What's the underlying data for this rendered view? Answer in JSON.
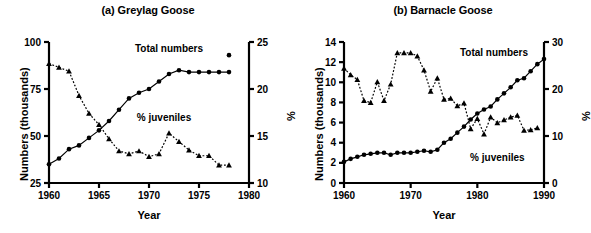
{
  "figure": {
    "panels": [
      {
        "id": "a",
        "title": "(a) Greylag Goose",
        "chart_index": 0
      },
      {
        "id": "b",
        "title": "(b) Barnacle Goose",
        "chart_index": 1
      }
    ]
  },
  "chart_data": [
    {
      "type": "line",
      "title": "(a) Greylag Goose",
      "xlabel": "Year",
      "ylabel": "Numbers (thousands)",
      "y2label": "%",
      "xlim": [
        1960,
        1980
      ],
      "ylim": [
        25,
        100
      ],
      "y2lim": [
        10,
        25
      ],
      "xticks": [
        1960,
        1965,
        1970,
        1975,
        1980
      ],
      "yticks": [
        25,
        50,
        75,
        100
      ],
      "y2ticks": [
        10,
        15,
        20,
        25
      ],
      "grid": false,
      "legend_position": "inline-annotation",
      "annotations": [
        {
          "text": "Total numbers",
          "x": 1972.0,
          "y_axis": "left",
          "y": 94.5
        },
        {
          "text": "% juveniles",
          "x": 1971.5,
          "y_axis": "right",
          "y": 16.6
        }
      ],
      "series": [
        {
          "name": "Total numbers",
          "axis": "left",
          "marker": "filled-circle",
          "linestyle": "solid",
          "x": [
            1960,
            1961,
            1962,
            1963,
            1964,
            1965,
            1966,
            1967,
            1968,
            1969,
            1970,
            1971,
            1972,
            1973,
            1974,
            1975,
            1976,
            1977,
            1978
          ],
          "values": [
            35,
            38,
            43,
            45,
            49,
            53,
            58,
            64,
            70,
            73,
            75,
            79,
            83,
            85,
            84,
            84,
            84,
            84,
            84
          ]
        },
        {
          "name": "Total numbers (continued)",
          "axis": "left",
          "marker": "filled-circle",
          "linestyle": "solid",
          "x": [
            1978
          ],
          "values": [
            93
          ]
        },
        {
          "name": "% juveniles",
          "axis": "right",
          "marker": "filled-triangle",
          "linestyle": "dotted",
          "x": [
            1960,
            1961,
            1962,
            1963,
            1964,
            1965,
            1966,
            1967,
            1968,
            1969,
            1970,
            1971,
            1972,
            1973,
            1974,
            1975,
            1976,
            1977,
            1978
          ],
          "values": [
            22.7,
            22.3,
            21.9,
            19.3,
            17.4,
            16.2,
            14.7,
            13.4,
            13.1,
            13.4,
            12.8,
            13.1,
            15.3,
            14.4,
            13.5,
            12.9,
            12.9,
            11.9,
            11.9
          ]
        }
      ]
    },
    {
      "type": "line",
      "title": "(b) Barnacle Goose",
      "xlabel": "Year",
      "ylabel": "Numbers (thousands)",
      "y2label": "%",
      "xlim": [
        1960,
        1990
      ],
      "ylim": [
        0,
        14
      ],
      "y2lim": [
        0,
        30
      ],
      "xticks": [
        1960,
        1970,
        1980,
        1990
      ],
      "yticks": [
        0,
        2,
        4,
        6,
        8,
        10,
        12,
        14
      ],
      "y2ticks": [
        0,
        10,
        20,
        30
      ],
      "grid": false,
      "legend_position": "inline-annotation",
      "annotations": [
        {
          "text": "Total numbers",
          "x": 1982.5,
          "y_axis": "left",
          "y": 12.6
        },
        {
          "text": "% juveniles",
          "x": 1983.0,
          "y_axis": "left",
          "y": 2.2
        }
      ],
      "series": [
        {
          "name": "Total numbers",
          "axis": "left",
          "marker": "filled-circle",
          "linestyle": "solid",
          "x": [
            1960,
            1961,
            1962,
            1963,
            1964,
            1965,
            1966,
            1967,
            1968,
            1969,
            1970,
            1971,
            1972,
            1973,
            1974,
            1975,
            1976,
            1977,
            1978,
            1979,
            1980,
            1981,
            1982,
            1983,
            1984,
            1985,
            1986,
            1987,
            1988,
            1989,
            1990
          ],
          "values": [
            2.1,
            2.4,
            2.6,
            2.8,
            2.9,
            3.0,
            3.0,
            2.8,
            3.0,
            3.0,
            3.0,
            3.1,
            3.2,
            3.1,
            3.3,
            4.0,
            4.4,
            5.0,
            5.6,
            6.3,
            6.9,
            7.3,
            7.6,
            8.3,
            8.9,
            9.5,
            10.2,
            10.4,
            11.1,
            11.8,
            12.3
          ]
        },
        {
          "name": "% juveniles",
          "axis": "right",
          "marker": "filled-triangle",
          "linestyle": "dotted",
          "x": [
            1960,
            1961,
            1962,
            1963,
            1964,
            1965,
            1966,
            1967,
            1968,
            1969,
            1970,
            1971,
            1972,
            1973,
            1974,
            1975,
            1976,
            1977,
            1978,
            1979,
            1980,
            1981,
            1982,
            1983,
            1984,
            1985,
            1986,
            1987,
            1988,
            1989
          ],
          "values": [
            24.4,
            23.0,
            22.0,
            17.5,
            17.1,
            21.5,
            17.5,
            21.0,
            27.7,
            27.7,
            27.7,
            27.0,
            24.0,
            19.5,
            22.3,
            17.8,
            18.0,
            16.4,
            17.0,
            11.5,
            13.7,
            10.4,
            14.0,
            12.8,
            13.4,
            14.0,
            14.4,
            11.2,
            11.3,
            11.7
          ]
        }
      ]
    }
  ]
}
